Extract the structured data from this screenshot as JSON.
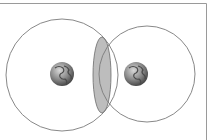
{
  "diagram": {
    "type": "overlapping-coverage-circles",
    "frame": {
      "stroke": "#9a9a9a"
    },
    "circles": [
      {
        "id": "left",
        "cx": 62,
        "cy": 75,
        "r": 56,
        "stroke": "#7a7a7a"
      },
      {
        "id": "right",
        "cx": 147,
        "cy": 74,
        "r": 48,
        "stroke": "#7a7a7a"
      }
    ],
    "overlap": {
      "fill": "#bdbdbd",
      "stroke": "#6a6a6a"
    },
    "globes": [
      {
        "id": "left-globe",
        "cx": 62,
        "cy": 74,
        "r": 12,
        "icon": "earth-globe-icon"
      },
      {
        "id": "right-globe",
        "cx": 136,
        "cy": 74,
        "r": 12,
        "icon": "earth-globe-icon"
      }
    ]
  }
}
